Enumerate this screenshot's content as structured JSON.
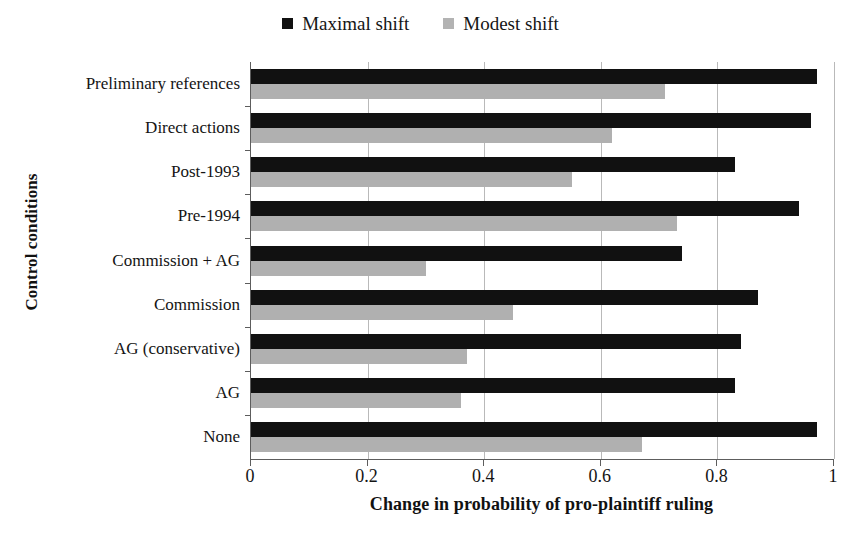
{
  "chart_data": {
    "type": "bar",
    "orientation": "horizontal",
    "title": "",
    "xlabel": "Change in probability of pro-plaintiff ruling",
    "ylabel": "Control conditions",
    "xlim": [
      0,
      1
    ],
    "xticks": [
      "0",
      "0.2",
      "0.4",
      "0.6",
      "0.8",
      "1"
    ],
    "xtick_values": [
      0,
      0.2,
      0.4,
      0.6,
      0.8,
      1
    ],
    "grid": true,
    "grid_axis": "x",
    "legend_position": "top-center",
    "categories": [
      "Preliminary references",
      "Direct actions",
      "Post-1993",
      "Pre-1994",
      "Commission + AG",
      "Commission",
      "AG (conservative)",
      "AG",
      "None"
    ],
    "series": [
      {
        "name": "Maximal shift",
        "color": "#111111",
        "values": [
          0.97,
          0.96,
          0.83,
          0.94,
          0.74,
          0.87,
          0.84,
          0.83,
          0.97
        ]
      },
      {
        "name": "Modest shift",
        "color": "#b0b0b0",
        "values": [
          0.71,
          0.62,
          0.55,
          0.73,
          0.3,
          0.45,
          0.37,
          0.36,
          0.67
        ]
      }
    ]
  },
  "legend": {
    "entries": [
      {
        "label": "Maximal shift",
        "swatch": "legend-swatch-black"
      },
      {
        "label": "Modest shift",
        "swatch": "legend-swatch-gray"
      }
    ]
  }
}
